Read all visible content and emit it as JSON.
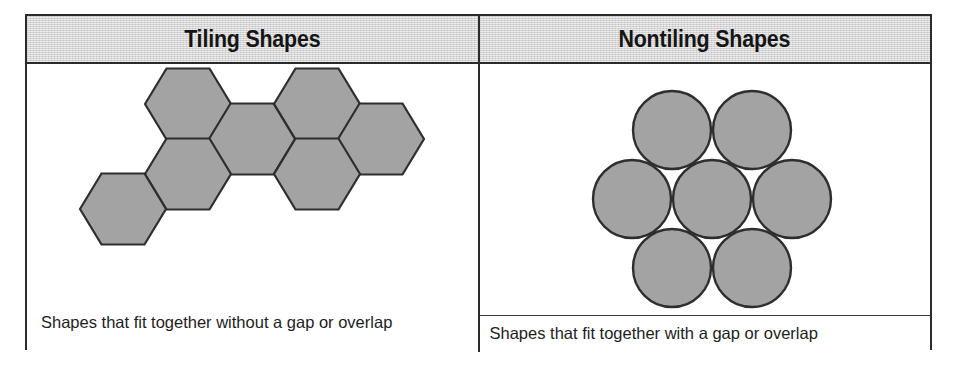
{
  "table": {
    "columns": [
      {
        "id": "tiling",
        "header": "Tiling Shapes",
        "caption": "Shapes that fit together without a gap or overlap",
        "figure": {
          "kind": "hexagon-tiling",
          "shape_name": "hexagon",
          "shape_count": 7,
          "fill_color": "#a3a3a3",
          "stroke_color": "#2e2e2e",
          "orientation": "flat-top",
          "hex_width": 86,
          "hex_height": 70,
          "centers": [
            [
              188,
              110
            ],
            [
              317,
              110
            ],
            [
              252,
              145
            ],
            [
              381,
              145
            ],
            [
              123,
              215
            ],
            [
              252,
              215
            ],
            [
              188,
              180
            ]
          ]
        }
      },
      {
        "id": "nontiling",
        "header": "Nontiling Shapes",
        "caption": "Shapes that fit together with a gap or overlap",
        "figure": {
          "kind": "circle-packing",
          "shape_name": "circle",
          "shape_count": 7,
          "fill_color": "#a3a3a3",
          "stroke_color": "#2e2e2e",
          "radius": 39,
          "centers": [
            [
              672,
              113
            ],
            [
              752,
              113
            ],
            [
              632,
              182
            ],
            [
              712,
              182
            ],
            [
              792,
              182
            ],
            [
              672,
              251
            ],
            [
              752,
              251
            ]
          ]
        }
      }
    ],
    "border_color": "#2b2b2b",
    "header_background": "#d5d5d5"
  }
}
